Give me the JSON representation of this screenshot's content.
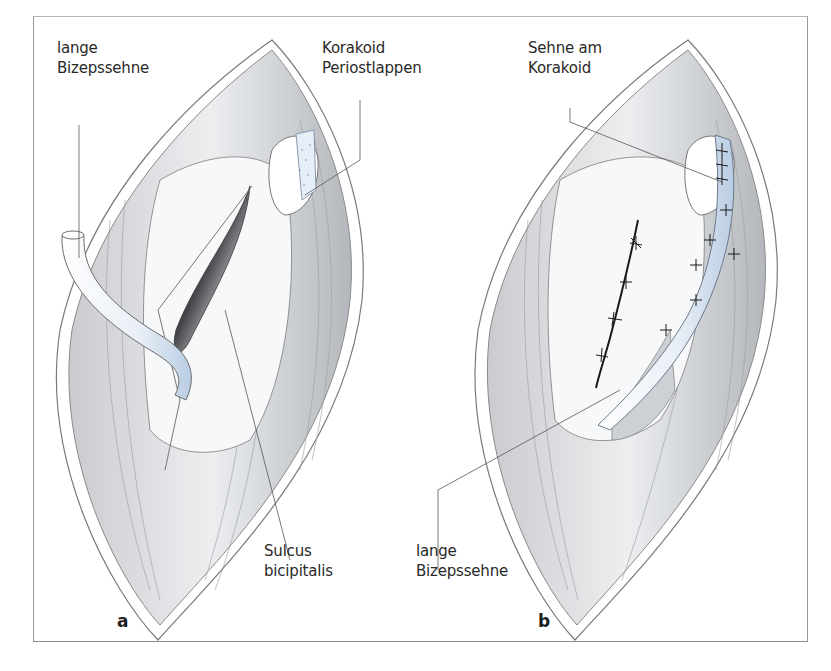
{
  "figure": {
    "panels": [
      {
        "id": "a",
        "letter": "a",
        "labels": [
          {
            "name": "lange-bizepssehne",
            "lines": [
              "lange",
              "Bizepssehne"
            ]
          },
          {
            "name": "korakoid-periostlappen",
            "lines": [
              "Korakoid",
              "Periostlappen"
            ]
          },
          {
            "name": "sulcus-bicipitalis",
            "lines": [
              "Sulcus",
              "bicipitalis"
            ]
          }
        ]
      },
      {
        "id": "b",
        "letter": "b",
        "labels": [
          {
            "name": "sehne-am-korakoid",
            "lines": [
              "Sehne am",
              "Korakoid"
            ]
          },
          {
            "name": "lange-bizepssehne",
            "lines": [
              "lange",
              "Bizepssehne"
            ]
          }
        ]
      }
    ],
    "colors": {
      "line": "#6b6b6b",
      "tissue": "#e4e6e8",
      "tissue_dark": "#b9bcc0",
      "tendon_blue": "#c9d9ea",
      "suture": "#1a1a1a",
      "sulcus_dark": "#5a5a5e"
    }
  }
}
